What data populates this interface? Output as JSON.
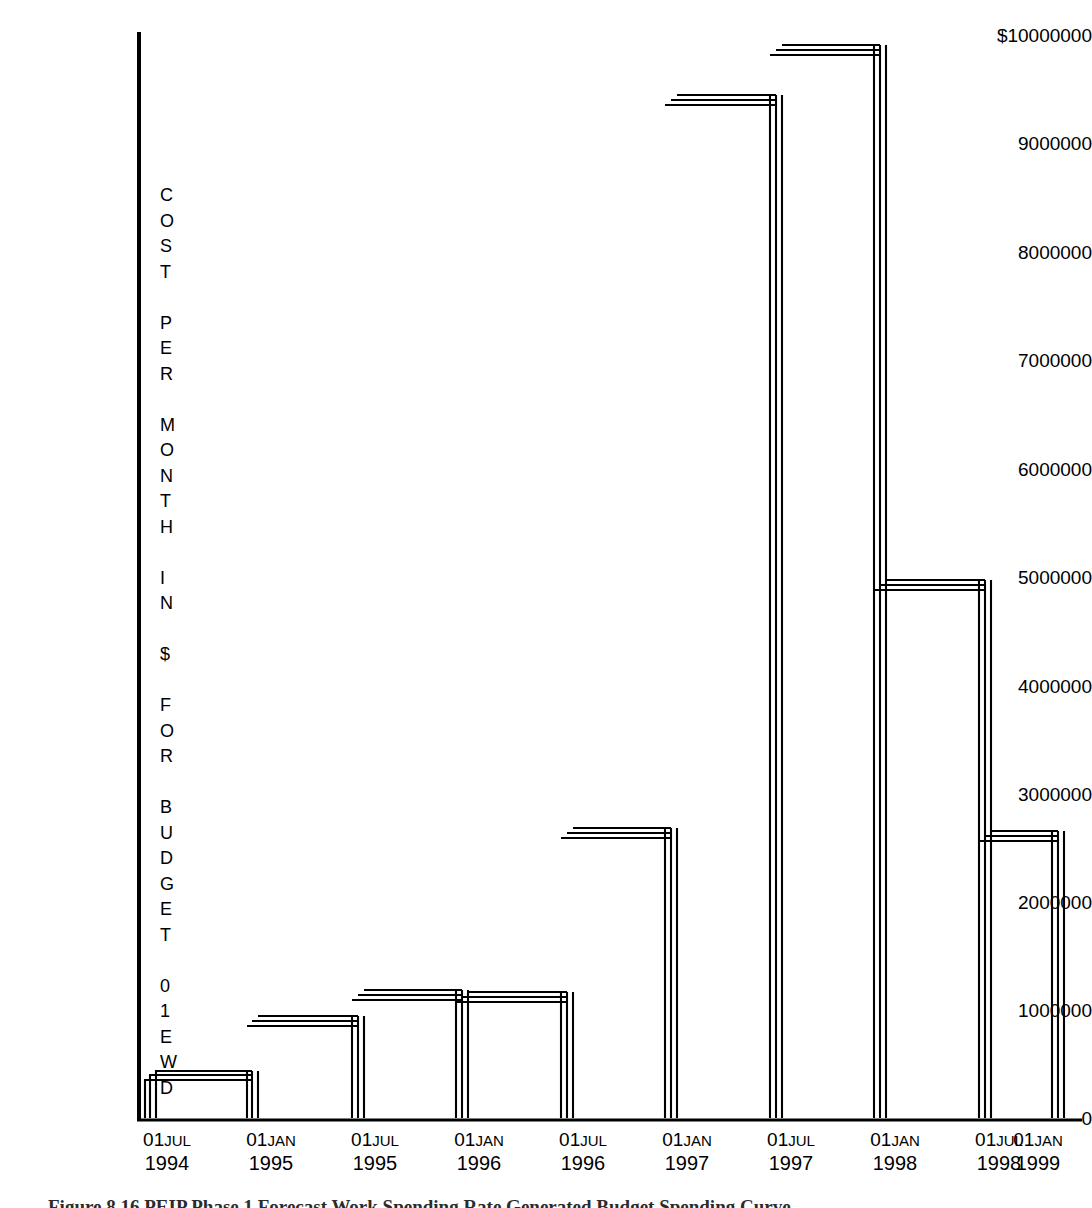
{
  "chart_data": {
    "type": "bar",
    "title": "",
    "xlabel": "",
    "ylabel": "COST PER MONTH IN $ FOR BUDGET 01EWD",
    "ylabel_chars": [
      "C",
      "O",
      "S",
      "T",
      "",
      "P",
      "E",
      "R",
      "",
      "M",
      "O",
      "N",
      "T",
      "H",
      "",
      "I",
      "N",
      "",
      "$",
      "",
      "F",
      "O",
      "R",
      "",
      "B",
      "U",
      "D",
      "G",
      "E",
      "T",
      "",
      "0",
      "1",
      "E",
      "W",
      "D"
    ],
    "categories": [
      "01JUL 1994",
      "01JAN 1995",
      "01JUL 1995",
      "01JAN 1996",
      "01JUL 1996",
      "01JAN 1997",
      "01JUL 1997",
      "01JAN 1998",
      "01JUL 1998",
      "01JAN 1999"
    ],
    "tick_labels": [
      {
        "day": "01",
        "month": "JUL",
        "year": "1994"
      },
      {
        "day": "01",
        "month": "JAN",
        "year": "1995"
      },
      {
        "day": "01",
        "month": "JUL",
        "year": "1995"
      },
      {
        "day": "01",
        "month": "JAN",
        "year": "1996"
      },
      {
        "day": "01",
        "month": "JUL",
        "year": "1996"
      },
      {
        "day": "01",
        "month": "JAN",
        "year": "1997"
      },
      {
        "day": "01",
        "month": "JUL",
        "year": "1997"
      },
      {
        "day": "01",
        "month": "JAN",
        "year": "1998"
      },
      {
        "day": "01",
        "month": "JUL",
        "year": "1998"
      },
      {
        "day": "01",
        "month": "JAN",
        "year": "1999"
      }
    ],
    "values": [
      350000,
      850000,
      1100000,
      1090000,
      2650000,
      9420000,
      9880000,
      4940000,
      2620000,
      2620000
    ],
    "ylim": [
      0,
      10000000
    ],
    "ytick_values": [
      0,
      1000000,
      2000000,
      3000000,
      4000000,
      5000000,
      6000000,
      7000000,
      8000000,
      9000000,
      10000000
    ],
    "ytick_labels": [
      "0",
      "1000000",
      "2000000",
      "3000000",
      "4000000",
      "5000000",
      "6000000",
      "7000000",
      "8000000",
      "9000000",
      "$10000000"
    ],
    "grid": false,
    "legend": null,
    "bar_style": "hollow-double-outline",
    "line_color": "#000000",
    "background_color": "#ffffff"
  },
  "caption": {
    "figure_number": "Figure 8.16",
    "text": "Figure 8.16 PEIP Phase 1 Forecast Work Spending Rate Generated Budget Spending Curve"
  }
}
